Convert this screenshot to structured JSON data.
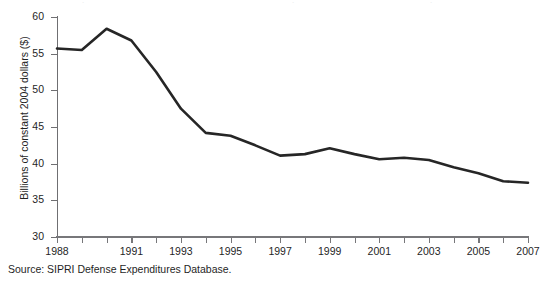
{
  "figure": {
    "caption": "Source: SIPRI Defense Expenditures Database."
  },
  "colors": {
    "line": "#262626",
    "axis": "#737376",
    "text": "#1f1f1f",
    "background": "#ffffff"
  },
  "chart_data": {
    "type": "line",
    "title": "",
    "subtitle": "",
    "xlabel": "",
    "ylabel": "Billions of constant 2004 dollars ($)",
    "xlim": [
      1987.5,
      2007.5
    ],
    "ylim": [
      30,
      60
    ],
    "ytick_values": [
      30,
      35,
      40,
      45,
      50,
      55,
      60
    ],
    "ytick_labels": [
      "30",
      "35",
      "40",
      "45",
      "50",
      "55",
      "60"
    ],
    "xtick_values": [
      1988,
      1989,
      1990,
      1991,
      1992,
      1993,
      1994,
      1995,
      1996,
      1997,
      1998,
      1999,
      2000,
      2001,
      2002,
      2003,
      2004,
      2005,
      2006,
      2007
    ],
    "xtick_labels": [
      "1988",
      "",
      "",
      "1991",
      "",
      "1993",
      "",
      "1995",
      "",
      "1997",
      "",
      "1999",
      "",
      "2001",
      "",
      "2003",
      "",
      "2005",
      "",
      "2007"
    ],
    "grid": false,
    "legend": null,
    "legend_position": "none",
    "annotations": [],
    "series": [
      {
        "name": "Defense expenditures",
        "x": [
          1988,
          1989,
          1990,
          1991,
          1992,
          1993,
          1994,
          1995,
          1996,
          1997,
          1998,
          1999,
          2000,
          2001,
          2002,
          2003,
          2004,
          2005,
          2006,
          2007
        ],
        "values": [
          55.7,
          55.5,
          58.4,
          56.8,
          52.5,
          47.5,
          44.2,
          43.8,
          42.5,
          41.1,
          41.3,
          42.1,
          41.3,
          40.6,
          40.8,
          40.5,
          39.5,
          38.7,
          37.6,
          37.4
        ]
      }
    ]
  }
}
